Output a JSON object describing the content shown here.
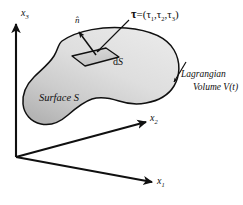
{
  "figure": {
    "background_color": "#ffffff",
    "line_color": "#101010",
    "blob_fill_light": "#e4e4e4",
    "blob_fill_dark": "#b9b9b9",
    "patch_fill": "#d2d2d2"
  },
  "axes": {
    "origin_label": "",
    "vertical": {
      "name": "x3",
      "base": "x",
      "sub": "3"
    },
    "right": {
      "name": "x2",
      "base": "x",
      "sub": "2"
    },
    "front": {
      "name": "x1",
      "base": "x",
      "sub": "1"
    }
  },
  "annotations": {
    "normal_vector": {
      "symbol": "n̂",
      "name": "unit-normal"
    },
    "traction": {
      "symbol": "τ",
      "equals": "=",
      "open": "(",
      "c1": "τ",
      "s1": "1",
      "comma1": ",",
      "c2": "τ",
      "s2": "2",
      "comma2": ",",
      "c3": "τ",
      "s3": "3",
      "close": ")",
      "full": "τ = (τ1, τ2, τ3)"
    },
    "area_element": {
      "d": "d",
      "S": "S",
      "full": "dS"
    },
    "surface": {
      "full": "Surface S",
      "word": "Surface",
      "symbol": "S"
    },
    "volume": {
      "line1": "Lagrangian",
      "line2": "Volume V(t)",
      "full": "Lagrangian Volume V(t)"
    }
  },
  "icons": {
    "axis_arrow": "arrow-head-icon",
    "leader_arrow": "leader-arrow-icon",
    "normal_arrow": "normal-arrow-icon",
    "traction_arrow": "traction-arrow-icon"
  }
}
